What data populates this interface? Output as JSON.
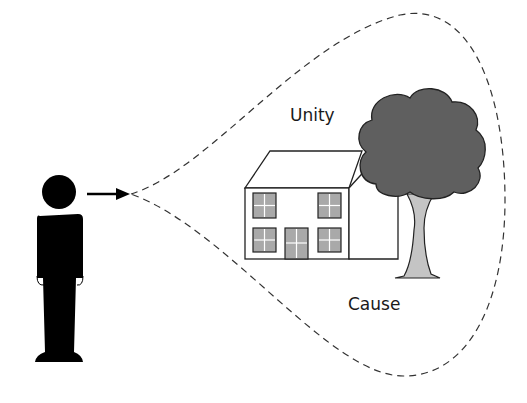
{
  "diagram": {
    "labels": {
      "unity": "Unity",
      "cause": "Cause"
    },
    "colors": {
      "figure": "#000000",
      "canopy": "#5f5f5f",
      "trunk": "#c4c4c4",
      "window": "#a9a9a9",
      "outline": "#222222",
      "dash": "#333333"
    },
    "elements": {
      "observer": "person-figure",
      "gaze": "arrow-right",
      "perception_field": "dashed-teardrop",
      "house": "house",
      "tree": "tree"
    }
  }
}
